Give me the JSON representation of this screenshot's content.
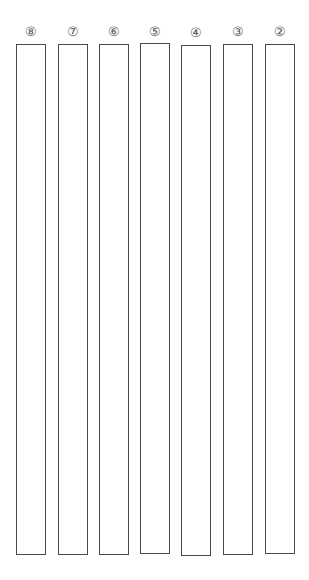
{
  "sheet": {
    "type": "answer-writing-columns",
    "border_color": "#4a4a4a",
    "label_color": "#555555",
    "columns": [
      {
        "label": "⑧",
        "number": 8,
        "left": 16,
        "top": 44,
        "width": 30,
        "height": 511
      },
      {
        "label": "⑦",
        "number": 7,
        "left": 58,
        "top": 44,
        "width": 30,
        "height": 511
      },
      {
        "label": "⑥",
        "number": 6,
        "left": 99,
        "top": 44,
        "width": 30,
        "height": 511
      },
      {
        "label": "⑤",
        "number": 5,
        "left": 140,
        "top": 43,
        "width": 30,
        "height": 511
      },
      {
        "label": "④",
        "number": 4,
        "left": 181,
        "top": 45,
        "width": 30,
        "height": 511
      },
      {
        "label": "③",
        "number": 3,
        "left": 223,
        "top": 44,
        "width": 30,
        "height": 511
      },
      {
        "label": "②",
        "number": 2,
        "left": 265,
        "top": 44,
        "width": 30,
        "height": 510
      }
    ]
  }
}
